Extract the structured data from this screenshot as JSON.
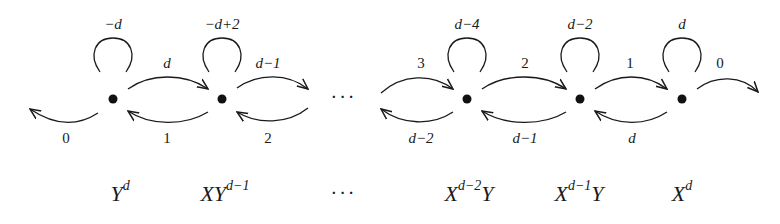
{
  "diagram": {
    "nodes": [
      {
        "id": "n1",
        "monomial": {
          "base": "Y",
          "exp": "d",
          "tail": ""
        },
        "loop": "−d",
        "right": "d",
        "left_in": "1",
        "left_out": "0"
      },
      {
        "id": "n2",
        "monomial": {
          "base": "XY",
          "exp": "d−1",
          "tail": ""
        },
        "loop": "−d+2",
        "right": "d−1",
        "left_in": "2"
      },
      {
        "id": "n3",
        "monomial": {
          "base": "X",
          "exp": "d−2",
          "tail": "Y"
        },
        "loop": "d−4",
        "right": "2",
        "in_left": "3",
        "out_left": "d−2"
      },
      {
        "id": "n4",
        "monomial": {
          "base": "X",
          "exp": "d−1",
          "tail": "Y"
        },
        "loop": "d−2",
        "right": "1",
        "from_right": "d−1"
      },
      {
        "id": "n5",
        "monomial": {
          "base": "X",
          "exp": "d",
          "tail": ""
        },
        "loop": "d",
        "right": "0",
        "from_right": "d"
      }
    ],
    "edge_labels": {
      "n1_loop": "−d",
      "n1_out_left": "0",
      "n1_to_n2": "d",
      "n2_to_n1": "1",
      "n2_loop": "−d+2",
      "n2_out_right": "d−1",
      "n2_in_right": "2",
      "n3_in_left": "3",
      "n3_out_left": "d−2",
      "n3_loop": "d−4",
      "n3_to_n4": "2",
      "n4_to_n3": "d−1",
      "n4_loop": "d−2",
      "n4_to_n5": "1",
      "n5_to_n4": "d",
      "n5_loop": "d",
      "n5_out_right": "0"
    },
    "ellipsis": "···",
    "monomials_ellipsis": "···"
  }
}
